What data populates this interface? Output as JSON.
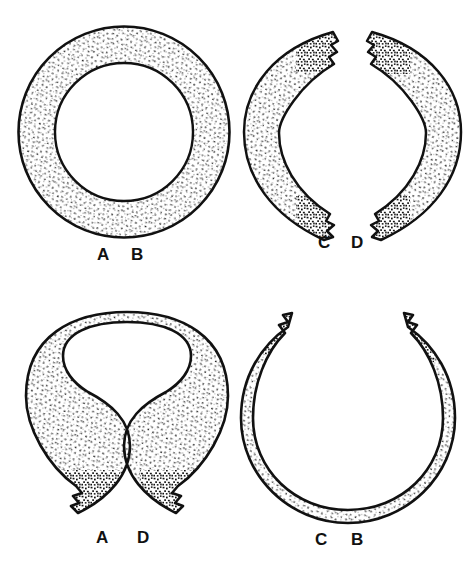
{
  "figure": {
    "type": "line-art-illustration",
    "background_color": "#ffffff",
    "ink_color": "#111111",
    "stipple_color": "#151515",
    "panels": [
      {
        "id": "panel-top-left",
        "shape": "complete-annulus",
        "description": "complete stippled ring, unbroken",
        "labels": [
          {
            "text": "A",
            "x": 97,
            "y": 246
          },
          {
            "text": "B",
            "x": 131,
            "y": 246
          }
        ]
      },
      {
        "id": "panel-top-right",
        "shape": "two-crescent-fragments",
        "description": "two separated crescent fragments facing away from each other with jagged broken ends",
        "labels": [
          {
            "text": "C",
            "x": 318,
            "y": 234
          },
          {
            "text": "D",
            "x": 351,
            "y": 234
          }
        ]
      },
      {
        "id": "panel-bottom-left",
        "shape": "ring-open-at-bottom",
        "description": "ring with gap at the bottom, jagged broken terminals",
        "labels": [
          {
            "text": "A",
            "x": 96,
            "y": 529
          },
          {
            "text": "D",
            "x": 137,
            "y": 529
          }
        ]
      },
      {
        "id": "panel-bottom-right",
        "shape": "ring-open-at-top",
        "description": "ring with gap at the top, jagged broken terminals",
        "labels": [
          {
            "text": "C",
            "x": 315,
            "y": 531
          },
          {
            "text": "B",
            "x": 351,
            "y": 531
          }
        ]
      }
    ]
  }
}
